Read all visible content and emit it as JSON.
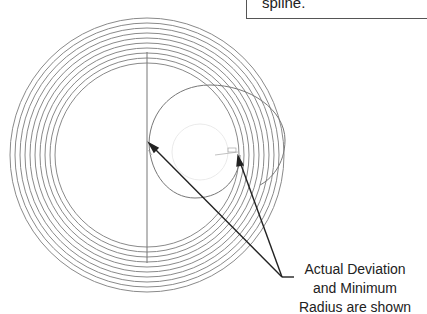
{
  "callout": {
    "text": "spline."
  },
  "annotation": {
    "lines": [
      "Actual Deviation",
      "and Minimum",
      "Radius are shown"
    ]
  },
  "diagram": {
    "ring_count": 10,
    "ring_color": "#8a8a8a",
    "arrow_color": "#222222"
  }
}
